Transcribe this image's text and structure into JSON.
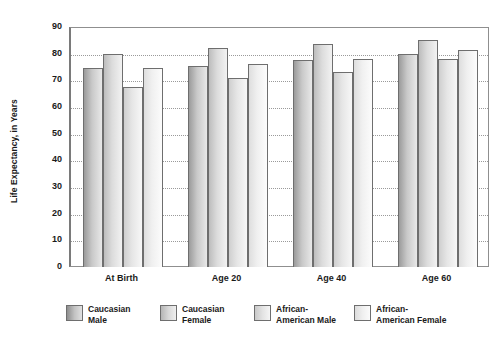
{
  "chart_data": {
    "type": "bar",
    "title": "",
    "xlabel": "",
    "ylabel": "Life Expectancy, in Years",
    "ylim": [
      0,
      90
    ],
    "ytick_step": 10,
    "grid": true,
    "legend_position": "bottom",
    "categories": [
      "At Birth",
      "Age 20",
      "Age 40",
      "Age 60"
    ],
    "ytick_labels": [
      "90",
      "80",
      "70",
      "60",
      "50",
      "40",
      "30",
      "20",
      "10",
      "0"
    ],
    "series": [
      {
        "name": "Caucasian Male",
        "name_line1": "Caucasian",
        "name_line2": "Male",
        "values": [
          74.5,
          75.5,
          77.5,
          80.0
        ],
        "color": "#c9c9c9"
      },
      {
        "name": "Caucasian Female",
        "name_line1": "Caucasian",
        "name_line2": "Female",
        "values": [
          80.0,
          82.0,
          83.5,
          85.0
        ],
        "color": "#dcdcdc"
      },
      {
        "name": "African-American Male",
        "name_line1": "African-",
        "name_line2": "American Male",
        "values": [
          67.5,
          71.0,
          73.0,
          78.0
        ],
        "color": "#e6e6e6"
      },
      {
        "name": "African-American Female",
        "name_line1": "African-",
        "name_line2": "American Female",
        "values": [
          74.5,
          76.0,
          78.0,
          81.5
        ],
        "color": "#f0f0f0"
      }
    ]
  },
  "colors": {
    "axis": "#7a7a7a",
    "gridline": "#9a9a9a",
    "bar_outline": "#6e6e6e",
    "text": "#1a1a1a",
    "background": "#ffffff"
  }
}
